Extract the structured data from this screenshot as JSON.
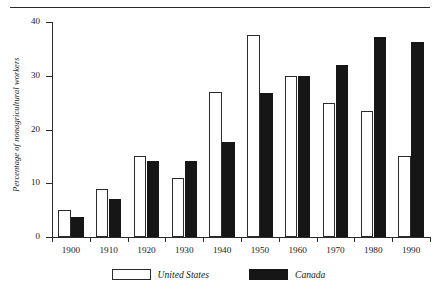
{
  "chart_data": {
    "type": "bar",
    "title": "",
    "xlabel": "",
    "ylabel": "Percentage of nonagricultural workers",
    "ylim": [
      0,
      40
    ],
    "yticks": [
      0,
      10,
      20,
      30,
      40
    ],
    "ytick_labels": [
      "0",
      "10",
      "20",
      "30",
      "40"
    ],
    "grid": false,
    "legend_position": "bottom-center",
    "categories": [
      "1900",
      "1910",
      "1920",
      "1930",
      "1940",
      "1950",
      "1960",
      "1970",
      "1980",
      "1990"
    ],
    "series": [
      {
        "name": "United States",
        "color": "#ffffff",
        "edge_color": "#2b2b2b",
        "values": [
          5,
          9,
          15,
          11,
          27,
          37.5,
          30,
          25,
          23.5,
          15
        ]
      },
      {
        "name": "Canada",
        "color": "#161616",
        "edge_color": "#161616",
        "values": [
          3.8,
          7,
          14.2,
          14.2,
          17.7,
          26.8,
          30,
          32,
          37.3,
          36.2
        ]
      }
    ]
  },
  "legend": {
    "entries": [
      {
        "label": "United States",
        "swatch": "open-square-swatch"
      },
      {
        "label": "Canada",
        "swatch": "filled-square-swatch"
      }
    ]
  },
  "colors": {
    "axis": "#2b2b2b",
    "canada_fill": "#161616",
    "united_states_fill": "#ffffff",
    "rule": "#2b2b2b"
  }
}
